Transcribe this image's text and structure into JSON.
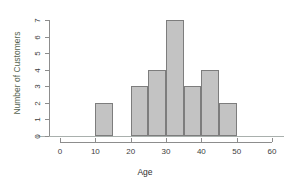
{
  "chart_data": {
    "type": "bar",
    "title": "",
    "subtitle": "",
    "xlabel": "Age",
    "ylabel": "Number of Customers",
    "xlim": [
      0,
      60
    ],
    "ylim": [
      0,
      7
    ],
    "bin_width": 5,
    "grid": false,
    "legend": false,
    "xticks": [
      "0",
      "10",
      "20",
      "30",
      "40",
      "50",
      "60"
    ],
    "xtick_values": [
      0,
      10,
      20,
      30,
      40,
      50,
      60
    ],
    "yticks": [
      "0",
      "1",
      "2",
      "3",
      "4",
      "5",
      "6",
      "7"
    ],
    "ytick_values": [
      0,
      1,
      2,
      3,
      4,
      5,
      6,
      7
    ],
    "categories": [
      "10-15",
      "15-20",
      "20-25",
      "25-30",
      "30-35",
      "35-40",
      "40-45",
      "45-50"
    ],
    "bins": [
      {
        "start": 10,
        "end": 15,
        "count": 2
      },
      {
        "start": 15,
        "end": 20,
        "count": 0
      },
      {
        "start": 20,
        "end": 25,
        "count": 3
      },
      {
        "start": 25,
        "end": 30,
        "count": 4
      },
      {
        "start": 30,
        "end": 35,
        "count": 7
      },
      {
        "start": 35,
        "end": 40,
        "count": 3
      },
      {
        "start": 40,
        "end": 45,
        "count": 4
      },
      {
        "start": 45,
        "end": 50,
        "count": 2
      }
    ],
    "values": [
      2,
      0,
      3,
      4,
      7,
      3,
      4,
      2
    ],
    "colors": {
      "bar_fill": "#c3c3c3",
      "bar_border": "#7d7d7d",
      "axis": "#8d8d8d",
      "baseline": "#a9b0ad",
      "xlabel_text": "#2f2f2f",
      "ylabel_text": "#55634f",
      "tick_text": "#3d3d3d",
      "background": "#ffffff"
    }
  }
}
